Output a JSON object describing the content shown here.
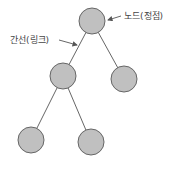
{
  "diagram": {
    "type": "tree",
    "colors": {
      "node_fill": "#c0c0c0",
      "node_stroke": "#666666",
      "edge": "#666666",
      "text": "#444444"
    },
    "nodes": [
      {
        "id": "root",
        "cx": 92,
        "cy": 21,
        "r": 13
      },
      {
        "id": "mid-left",
        "cx": 63,
        "cy": 76,
        "r": 13
      },
      {
        "id": "mid-right",
        "cx": 124,
        "cy": 79,
        "r": 13
      },
      {
        "id": "bottom-left",
        "cx": 31,
        "cy": 140,
        "r": 13
      },
      {
        "id": "bottom-right",
        "cx": 91,
        "cy": 142,
        "r": 13
      }
    ],
    "edges": [
      {
        "from": "root",
        "to": "mid-left"
      },
      {
        "from": "root",
        "to": "mid-right"
      },
      {
        "from": "mid-left",
        "to": "bottom-left"
      },
      {
        "from": "mid-left",
        "to": "bottom-right"
      }
    ],
    "annotations": {
      "node_label": "노드(정점)",
      "edge_label": "간선(링크)"
    }
  }
}
